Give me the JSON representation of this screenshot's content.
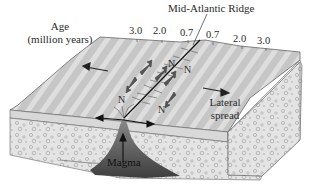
{
  "title": "Mid-Atlantic Ridge",
  "age_label": {
    "line1": "Age",
    "line2": "(million years)"
  },
  "age_ticks": {
    "left": [
      "3.0",
      "2.0",
      "0.7"
    ],
    "right": [
      "0.7",
      "2.0",
      "3.0"
    ]
  },
  "labels": {
    "lateral_line1": "Lateral",
    "lateral_line2": "spread",
    "magma": "Magma",
    "polarity": "N"
  },
  "colors": {
    "surface": "#c9c9c9",
    "stripe": "#e6e6e6",
    "crust_front": "#dcdcdc",
    "mantle": "#e8e8e8",
    "magma": "#5a5a5a",
    "outline": "#555555",
    "arrow": "#333333"
  }
}
